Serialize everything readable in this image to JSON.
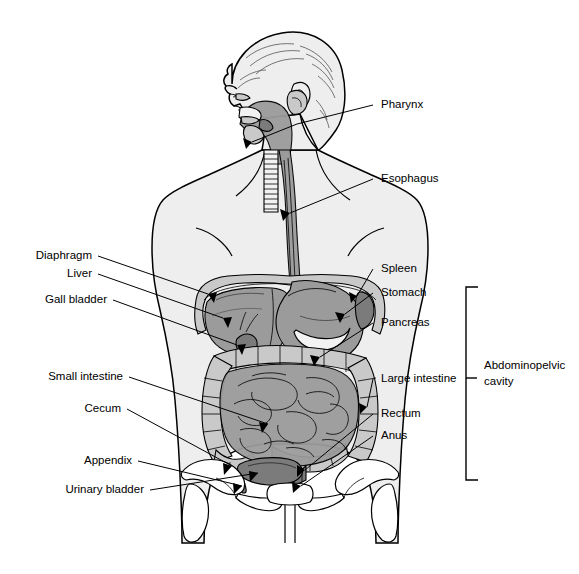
{
  "figure": {
    "view": "anterior torso with sagittal head profile"
  },
  "colors": {
    "body": "#eeeeee",
    "organ_mid": "#9b9b9b",
    "organ_dark": "#7b7b7b",
    "organ_light": "#c9c9c9",
    "bone": "#ffffff",
    "line": "#000000",
    "background": "#ffffff"
  },
  "labels_left": [
    {
      "id": "diaphragm",
      "text": "Diaphragm"
    },
    {
      "id": "liver",
      "text": "Liver"
    },
    {
      "id": "gall-bladder",
      "text": "Gall bladder"
    },
    {
      "id": "small-intestine",
      "text": "Small intestine"
    },
    {
      "id": "cecum",
      "text": "Cecum"
    },
    {
      "id": "appendix",
      "text": "Appendix"
    },
    {
      "id": "urinary-bladder",
      "text": "Urinary bladder"
    }
  ],
  "labels_right": [
    {
      "id": "pharynx",
      "text": "Pharynx"
    },
    {
      "id": "esophagus",
      "text": "Esophagus"
    },
    {
      "id": "spleen",
      "text": "Spleen"
    },
    {
      "id": "stomach",
      "text": "Stomach"
    },
    {
      "id": "pancreas",
      "text": "Pancreas"
    },
    {
      "id": "large-intestine",
      "text": "Large intestine"
    },
    {
      "id": "rectum",
      "text": "Rectum"
    },
    {
      "id": "anus",
      "text": "Anus"
    }
  ],
  "bracket": {
    "id": "abdominopelvic-cavity",
    "line1": "Abdominopelvic",
    "line2": "cavity"
  }
}
